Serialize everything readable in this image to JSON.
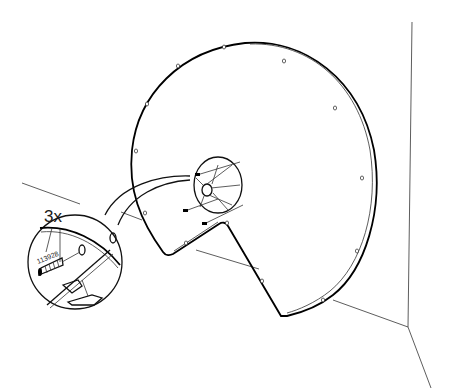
{
  "diagram": {
    "callout": {
      "quantity_label": "3x",
      "part_number": "113928",
      "parts": [
        "screw",
        "wall-plug"
      ]
    },
    "components": [
      "wall-corner",
      "floor-line",
      "disc-panel",
      "mounting-bracket",
      "mounting-holes",
      "magnifier-callout"
    ],
    "colors": {
      "line": "#000000",
      "background": "#ffffff"
    }
  }
}
